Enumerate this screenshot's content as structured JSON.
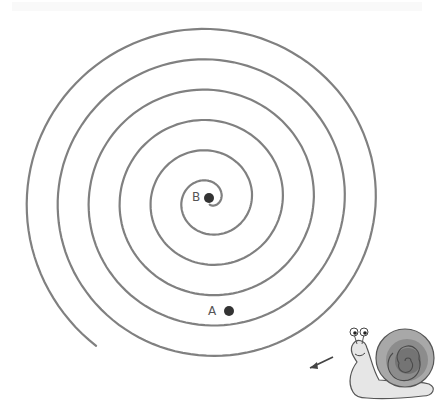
{
  "diagram": {
    "type": "spiral-maze",
    "stroke_color": "#808080",
    "background": "#ffffff",
    "spiral": {
      "center": [
        209,
        200
      ],
      "ring_spacing": 31,
      "turns": 5.9,
      "aspect_y": 0.98
    },
    "points": [
      {
        "id": "A",
        "label": "A",
        "x": 229,
        "y": 311,
        "label_x": 208,
        "label_y": 304,
        "color": "#333333"
      },
      {
        "id": "B",
        "label": "B",
        "x": 209,
        "y": 198,
        "label_x": 192,
        "label_y": 190,
        "color": "#333333"
      }
    ],
    "arrow": {
      "from": [
        333,
        357
      ],
      "to": [
        310,
        368
      ],
      "color": "#444444"
    },
    "snail": {
      "x": 345,
      "y": 322,
      "shell_color": "#8a8a8a",
      "body_color": "#e4e4e4"
    }
  }
}
